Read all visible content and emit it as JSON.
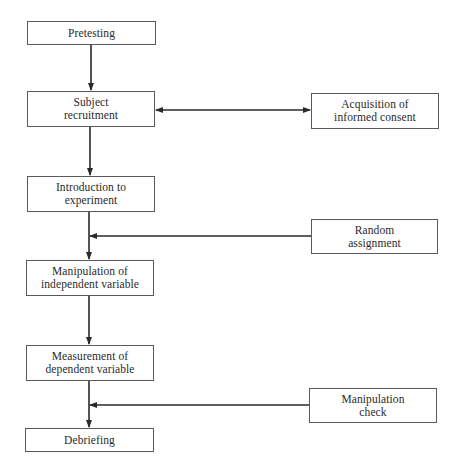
{
  "diagram": {
    "type": "flowchart",
    "colors": {
      "stroke": "#2a2a2a",
      "box_border": "#5a5a5a",
      "text": "#2a2a2a",
      "background": "#ffffff"
    },
    "main_flow": [
      {
        "id": "pretesting",
        "label": "Pretesting"
      },
      {
        "id": "subject_recruitment",
        "label": "Subject\nrecruitment"
      },
      {
        "id": "introduction",
        "label": "Introduction to\nexperiment"
      },
      {
        "id": "manipulation_iv",
        "label": "Manipulation of\nindependent variable"
      },
      {
        "id": "measurement_dv",
        "label": "Measurement of\ndependent variable"
      },
      {
        "id": "debriefing",
        "label": "Debriefing"
      }
    ],
    "side_nodes": [
      {
        "id": "informed_consent",
        "label": "Acquisition of\ninformed consent",
        "connects_to": "subject_recruitment",
        "arrow": "bidirectional"
      },
      {
        "id": "random_assignment",
        "label": "Random\nassignment",
        "connects_to": "introduction->manipulation_iv",
        "arrow": "into-flow"
      },
      {
        "id": "manipulation_check",
        "label": "Manipulation\ncheck",
        "connects_to": "measurement_dv->debriefing",
        "arrow": "into-flow"
      }
    ]
  }
}
